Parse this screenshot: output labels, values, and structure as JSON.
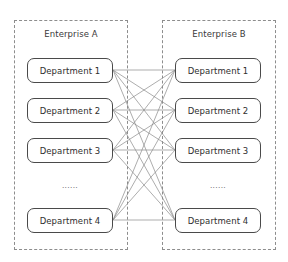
{
  "diagram": {
    "type": "bipartite-network",
    "stroke_color": "#8a8a8a",
    "box_border_color": "#4a4a4a",
    "container_border_color": "#8d8d8d",
    "background_color": "#ffffff"
  },
  "enterprises": [
    {
      "id": "enterprise-a",
      "label": "Enterprise A",
      "ellipsis": "......",
      "departments": [
        {
          "label": "Department 1"
        },
        {
          "label": "Department 2"
        },
        {
          "label": "Department 3"
        },
        {
          "label": "Department 4"
        }
      ]
    },
    {
      "id": "enterprise-b",
      "label": "Enterprise B",
      "ellipsis": "......",
      "departments": [
        {
          "label": "Department 1"
        },
        {
          "label": "Department 2"
        },
        {
          "label": "Department 3"
        },
        {
          "label": "Department 4"
        }
      ]
    }
  ],
  "connections": {
    "description": "Every department of Enterprise A is linked to every department of Enterprise B",
    "count": 16,
    "pairs": [
      [
        1,
        1
      ],
      [
        1,
        2
      ],
      [
        1,
        3
      ],
      [
        1,
        4
      ],
      [
        2,
        1
      ],
      [
        2,
        2
      ],
      [
        2,
        3
      ],
      [
        2,
        4
      ],
      [
        3,
        1
      ],
      [
        3,
        2
      ],
      [
        3,
        3
      ],
      [
        3,
        4
      ],
      [
        4,
        1
      ],
      [
        4,
        2
      ],
      [
        4,
        3
      ],
      [
        4,
        4
      ]
    ]
  },
  "geometry": {
    "left_anchor_x": 113,
    "right_anchor_x": 175,
    "row_centers_y": [
      70,
      110,
      150,
      220
    ]
  }
}
